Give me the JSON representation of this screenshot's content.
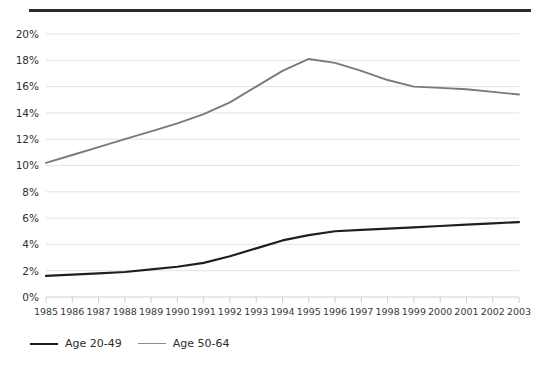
{
  "chart_data": {
    "type": "line",
    "title": "",
    "subtitle": "",
    "xlabel": "",
    "ylabel": "",
    "grid": true,
    "legend_position": "bottom-left",
    "categories": [
      "1985",
      "1986",
      "1987",
      "1988",
      "1989",
      "1990",
      "1991",
      "1992",
      "1993",
      "1994",
      "1995",
      "1996",
      "1997",
      "1998",
      "1999",
      "2000",
      "2001",
      "2002",
      "2003"
    ],
    "x": [
      1985,
      1986,
      1987,
      1988,
      1989,
      1990,
      1991,
      1992,
      1993,
      1994,
      1995,
      1996,
      1997,
      1998,
      1999,
      2000,
      2001,
      2002,
      2003
    ],
    "xlim": [
      1985,
      2003
    ],
    "ylim": [
      0,
      20
    ],
    "ytick_values": [
      0,
      2,
      4,
      6,
      8,
      10,
      12,
      14,
      16,
      18,
      20
    ],
    "ytick_labels": [
      "0%",
      "2%",
      "4%",
      "6%",
      "8%",
      "10%",
      "12%",
      "14%",
      "16%",
      "18%",
      "20%"
    ],
    "y_unit": "%",
    "series": [
      {
        "name": "Age 20-49",
        "color": "#1f1f1f",
        "width": 2.2,
        "values": [
          1.6,
          1.7,
          1.8,
          1.9,
          2.1,
          2.3,
          2.6,
          3.1,
          3.7,
          4.3,
          4.7,
          5.0,
          5.1,
          5.2,
          5.3,
          5.4,
          5.5,
          5.6,
          5.7
        ]
      },
      {
        "name": "Age 50-64",
        "color": "#7a7a7a",
        "width": 1.9,
        "values": [
          10.2,
          10.8,
          11.4,
          12.0,
          12.6,
          13.2,
          13.9,
          14.8,
          16.0,
          17.2,
          18.1,
          17.8,
          17.2,
          16.5,
          16.0,
          15.9,
          15.8,
          15.6,
          15.4
        ]
      }
    ]
  },
  "legend": {
    "items": [
      {
        "label": "Age 20-49",
        "color": "#1f1f1f",
        "width": 2.4
      },
      {
        "label": "Age 50-64",
        "color": "#8c8c8c",
        "width": 1.8
      }
    ]
  },
  "decor": {
    "top_rule_color": "#2b2b2b"
  }
}
